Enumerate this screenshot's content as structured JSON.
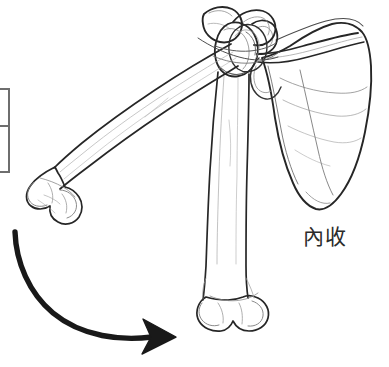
{
  "page": {
    "width": 389,
    "height": 367,
    "background_color": "#ffffff",
    "kind": "anatomical-line-drawing"
  },
  "figure": {
    "title_label": "內收",
    "label_meaning_note": "adduction",
    "label_color": "#2b2b2b",
    "ink_color": "#1a1a1a",
    "line_color_outline": "#262626",
    "line_color_detail": "#8c8c8c",
    "arrow_color": "#191919",
    "structures": [
      {
        "name": "scapula",
        "label": "scapula"
      },
      {
        "name": "clavicle",
        "label": "clavicle"
      },
      {
        "name": "humerus-abducted",
        "label": "humerus (abducted position)"
      },
      {
        "name": "humerus-adducted",
        "label": "humerus (adducted position)"
      },
      {
        "name": "glenohumeral-joint",
        "label": "glenohumeral joint"
      }
    ],
    "motion_arrow": {
      "name": "adduction-motion-arrow",
      "direction": "curved from upper-left downward to the right",
      "start_x": 15,
      "start_y": 232,
      "tip_x": 176,
      "tip_y": 337
    }
  },
  "partial_table": {
    "name": "partial-table-left-edge",
    "rows": 2,
    "border_color": "#6e6e6e",
    "cells": [
      "",
      ""
    ]
  }
}
